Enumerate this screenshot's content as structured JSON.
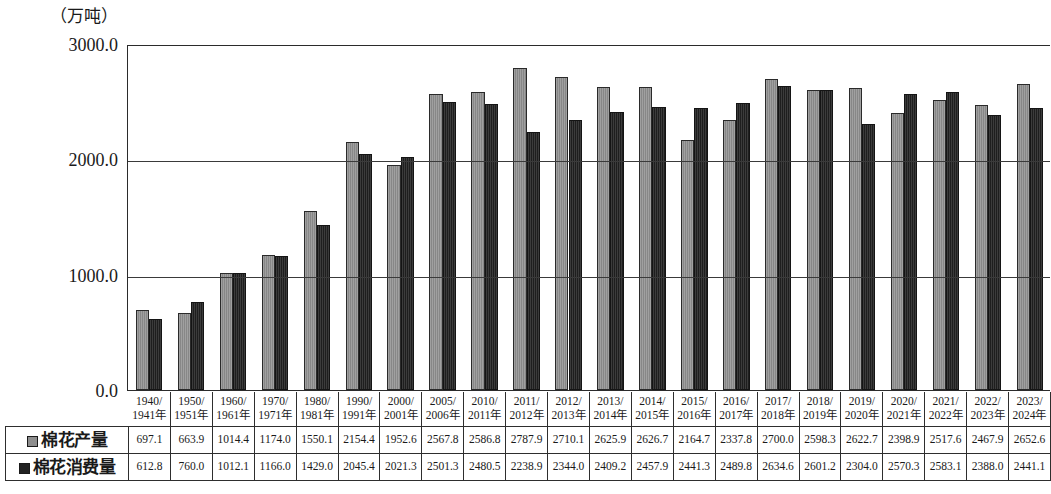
{
  "axis": {
    "unit_label": "（万吨）",
    "y_ticks": [
      "0.0",
      "1000.0",
      "2000.0",
      "3000.0"
    ]
  },
  "legend": {
    "production_label": "棉花产量",
    "consumption_label": "棉花消费量",
    "production_color": "#8e8e8e",
    "consumption_color": "#262626"
  },
  "chart_data": {
    "type": "bar",
    "title": "",
    "xlabel": "",
    "ylabel": "（万吨）",
    "ylim": [
      0,
      3000
    ],
    "grid": true,
    "legend_position": "table-left",
    "categories": [
      "1940/1941年",
      "1950/1951年",
      "1960/1961年",
      "1970/1971年",
      "1980/1981年",
      "1990/1991年",
      "2000/2001年",
      "2005/2006年",
      "2010/2011年",
      "2011/2012年",
      "2012/2013年",
      "2013/2014年",
      "2014/2015年",
      "2015/2016年",
      "2016/2017年",
      "2017/2018年",
      "2018/2019年",
      "2019/2020年",
      "2020/2021年",
      "2021/2022年",
      "2022/2023年",
      "2023/2024年"
    ],
    "categories_lines": [
      [
        "1940/",
        "1941年"
      ],
      [
        "1950/",
        "1951年"
      ],
      [
        "1960/",
        "1961年"
      ],
      [
        "1970/",
        "1971年"
      ],
      [
        "1980/",
        "1981年"
      ],
      [
        "1990/",
        "1991年"
      ],
      [
        "2000/",
        "2001年"
      ],
      [
        "2005/",
        "2006年"
      ],
      [
        "2010/",
        "2011年"
      ],
      [
        "2011/",
        "2012年"
      ],
      [
        "2012/",
        "2013年"
      ],
      [
        "2013/",
        "2014年"
      ],
      [
        "2014/",
        "2015年"
      ],
      [
        "2015/",
        "2016年"
      ],
      [
        "2016/",
        "2017年"
      ],
      [
        "2017/",
        "2018年"
      ],
      [
        "2018/",
        "2019年"
      ],
      [
        "2019/",
        "2020年"
      ],
      [
        "2020/",
        "2021年"
      ],
      [
        "2021/",
        "2022年"
      ],
      [
        "2022/",
        "2023年"
      ],
      [
        "2023/",
        "2024年"
      ]
    ],
    "series": [
      {
        "name": "棉花产量",
        "color": "#8e8e8e",
        "values": [
          697.1,
          663.9,
          1014.4,
          1174.0,
          1550.1,
          2154.4,
          1952.6,
          2567.8,
          2586.8,
          2787.9,
          2710.1,
          2625.9,
          2626.7,
          2164.7,
          2337.8,
          2700.0,
          2598.3,
          2622.7,
          2398.9,
          2517.6,
          2467.9,
          2652.6
        ],
        "labels": [
          "697.1",
          "663.9",
          "1014.4",
          "1174.0",
          "1550.1",
          "2154.4",
          "1952.6",
          "2567.8",
          "2586.8",
          "2787.9",
          "2710.1",
          "2625.9",
          "2626.7",
          "2164.7",
          "2337.8",
          "2700.0",
          "2598.3",
          "2622.7",
          "2398.9",
          "2517.6",
          "2467.9",
          "2652.6"
        ]
      },
      {
        "name": "棉花消费量",
        "color": "#262626",
        "values": [
          612.8,
          760.0,
          1012.1,
          1166.0,
          1429.0,
          2045.4,
          2021.3,
          2501.3,
          2480.5,
          2238.9,
          2344.0,
          2409.2,
          2457.9,
          2441.3,
          2489.8,
          2634.6,
          2601.2,
          2304.0,
          2570.3,
          2583.1,
          2388.0,
          2441.1
        ],
        "labels": [
          "612.8",
          "760.0",
          "1012.1",
          "1166.0",
          "1429.0",
          "2045.4",
          "2021.3",
          "2501.3",
          "2480.5",
          "2238.9",
          "2344.0",
          "2409.2",
          "2457.9",
          "2441.3",
          "2489.8",
          "2634.6",
          "2601.2",
          "2304.0",
          "2570.3",
          "2583.1",
          "2388.0",
          "2441.1"
        ]
      }
    ]
  }
}
